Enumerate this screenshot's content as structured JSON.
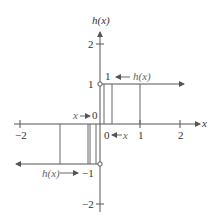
{
  "diagram": {
    "y_axis_label": "h(x)",
    "x_axis_label": "x",
    "x_ticks": [
      {
        "value": -2,
        "label": "−2"
      },
      {
        "value": 1,
        "label": "1"
      },
      {
        "value": 2,
        "label": "2"
      }
    ],
    "y_ticks": [
      {
        "value": 2,
        "label": "2"
      },
      {
        "value": 1,
        "label": "1"
      },
      {
        "value": -1,
        "label": "−1"
      },
      {
        "value": -2,
        "label": "−2"
      }
    ],
    "annotations": {
      "right_limit_value": "1",
      "right_limit_func": "h(x)",
      "right_approach_zero": "0",
      "right_approach_x": "x",
      "left_approach_x": "x",
      "left_approach_zero": "0",
      "left_limit_func": "h(x)",
      "left_limit_value": "−1"
    },
    "colors": {
      "line": "#555555",
      "text": "#333333"
    }
  }
}
